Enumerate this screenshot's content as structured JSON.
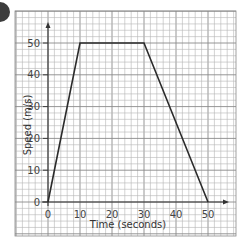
{
  "badge": {
    "color": "#3c3c3c"
  },
  "colors": {
    "grid_minor": "#b5b5b5",
    "grid_major": "#8a8a8a",
    "axis": "#333333",
    "line": "#2b2b2b"
  },
  "chart_data": {
    "type": "line",
    "title": "",
    "xlabel": "Time (seconds)",
    "ylabel": "Speed (m/s)",
    "xlim": [
      0,
      50
    ],
    "ylim": [
      0,
      50
    ],
    "x_ticks": [
      "0",
      "10",
      "20",
      "30",
      "40",
      "50"
    ],
    "y_ticks": [
      "0",
      "10",
      "20",
      "30",
      "40",
      "50"
    ],
    "grid": true,
    "grid_minor_step": 2,
    "legend": null,
    "series": [
      {
        "name": "speed-time",
        "x": [
          0,
          10,
          30,
          50
        ],
        "y": [
          0,
          50,
          50,
          0
        ]
      }
    ]
  }
}
